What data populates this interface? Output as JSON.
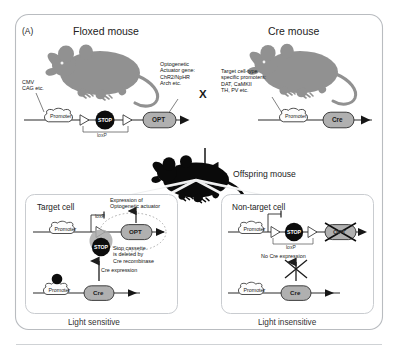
{
  "figure": {
    "panel_label": "(A)",
    "frame_color": "#b9bcc0",
    "bg_color": "#ffffff"
  },
  "top": {
    "left_title": "Floxed mouse",
    "right_title": "Cre mouse",
    "cross_symbol": "X",
    "offspring_title": "Offspring mouse",
    "floxed_promoter_note": "CMV\nCAG etc.",
    "actuator_note": "Optogenetic\nActuator gene:\nChR2/NpHR\nArch etc.",
    "cre_promoter_note": "Target cell-type\nspecific promoters:\nDAT, CaMKII\nTH, PV etc.",
    "floxed_construct": {
      "promoter_label": "Promoter",
      "stop_label": "STOP",
      "gene_label": "OPT",
      "loxp_label": "loxP"
    },
    "cre_construct": {
      "promoter_label": "Promoter",
      "gene_label": "Cre"
    }
  },
  "bottom_left": {
    "panel_title": "Target cell",
    "expression_note": "Expression of\nOptogenetic actuator",
    "loxp_label": "loxP",
    "promoter_label": "Promoter",
    "stop_label": "STOP",
    "gene_label": "OPT",
    "deletion_note": "Stop cassette\nis deleted by\nCre recombinase",
    "cre_expression_note": "Cre expression",
    "cre_promoter_label": "Promoter",
    "cre_gene_label": "Cre",
    "caption": "Light sensitive"
  },
  "bottom_right": {
    "panel_title": "Non-target cell",
    "loxp_label": "loxP",
    "no_cre_note": "No Cre expression",
    "promoter_label": "Promoter",
    "stop_label": "STOP",
    "gene_label": "OPT",
    "cre_promoter_label": "Promoter",
    "cre_gene_label": "Cre",
    "caption": "Light insensitive"
  },
  "colors": {
    "mouse_grey": "#8d8d8d",
    "mouse_black": "#0a0a0a",
    "gene_fill": "#b0b0b0",
    "stop_fill": "#0d0d0d",
    "promoter_fill": "#fdfdfd",
    "line": "#2b2b2b",
    "panel_border": "#c9ccd0"
  }
}
